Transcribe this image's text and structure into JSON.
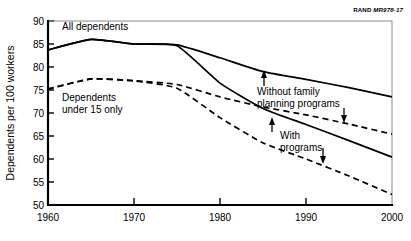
{
  "source_tag": {
    "brand": "RAND",
    "code": "MR978-17"
  },
  "chart_data": {
    "type": "line",
    "title": "",
    "xlabel": "",
    "ylabel": "Dependents per 100 workers",
    "xlim": [
      1960,
      2000
    ],
    "ylim": [
      50,
      90
    ],
    "xticks": [
      1960,
      1970,
      1980,
      1990,
      2000
    ],
    "yticks": [
      50,
      55,
      60,
      65,
      70,
      75,
      80,
      85,
      90
    ],
    "grid": false,
    "legend_position": "inline-annotations",
    "series": [
      {
        "name": "All dependents, without family planning programs",
        "style": "solid",
        "x": [
          1960,
          1965,
          1970,
          1975,
          1980,
          1985,
          1990,
          1995,
          2000
        ],
        "values": [
          83.7,
          86.0,
          85.0,
          84.8,
          82.0,
          79.0,
          77.3,
          75.5,
          73.5
        ]
      },
      {
        "name": "All dependents, with programs",
        "style": "solid",
        "x": [
          1960,
          1965,
          1970,
          1975,
          1980,
          1985,
          1990,
          1995,
          2000
        ],
        "values": [
          83.7,
          86.0,
          85.0,
          84.6,
          76.5,
          71.0,
          67.5,
          64.0,
          60.4
        ]
      },
      {
        "name": "Dependents under 15 only, without family planning programs",
        "style": "dashed",
        "x": [
          1960,
          1965,
          1970,
          1975,
          1980,
          1985,
          1990,
          1995,
          2000
        ],
        "values": [
          75.2,
          77.4,
          77.0,
          76.2,
          73.5,
          71.3,
          69.6,
          67.6,
          65.4
        ]
      },
      {
        "name": "Dependents under 15 only, with programs",
        "style": "dashed",
        "x": [
          1960,
          1965,
          1970,
          1975,
          1980,
          1985,
          1990,
          1995,
          2000
        ],
        "values": [
          75.2,
          77.4,
          77.0,
          75.4,
          69.0,
          63.5,
          60.0,
          56.3,
          52.3
        ]
      }
    ],
    "annotations": [
      {
        "text": "All dependents",
        "role": "series-group-label"
      },
      {
        "text_line1": "Dependents",
        "text_line2": "under 15 only",
        "role": "series-group-label"
      },
      {
        "text_line1": "Without family",
        "text_line2": "planning programs",
        "role": "scenario-label"
      },
      {
        "text_line1": "With",
        "text_line2": "programs",
        "role": "scenario-label"
      }
    ]
  },
  "labels": {
    "y_axis_title": "Dependents per 100 workers",
    "all_dependents": "All dependents",
    "under15_line1": "Dependents",
    "under15_line2": "under 15 only",
    "without_line1": "Without family",
    "without_line2": "planning programs",
    "with_line1": "With",
    "with_line2": "programs",
    "yticks": [
      "90",
      "85",
      "80",
      "75",
      "70",
      "65",
      "60",
      "55",
      "50"
    ],
    "xticks": [
      "1960",
      "1970",
      "1980",
      "1990",
      "2000"
    ]
  }
}
